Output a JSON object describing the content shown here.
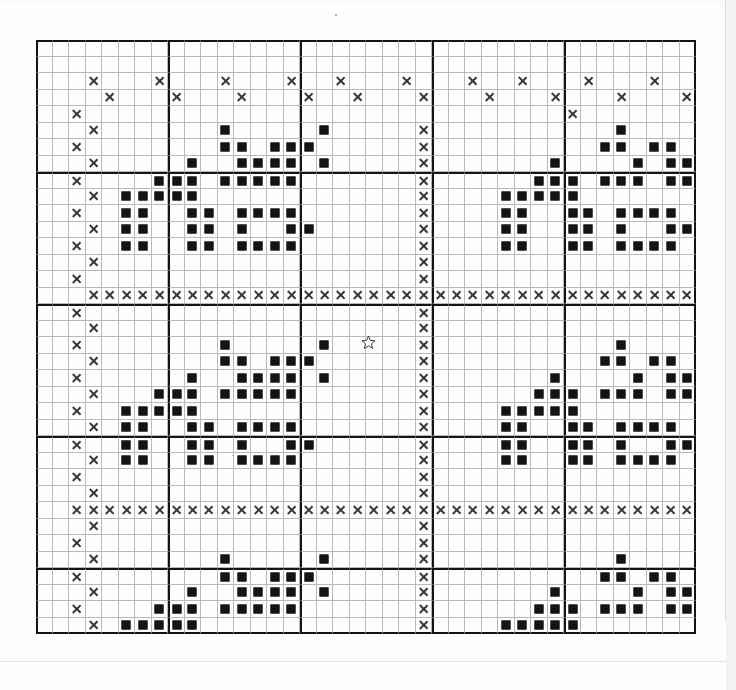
{
  "document": {
    "type": "cross-stitch-pattern-chart",
    "title": "Cross Stitch Pattern Chart",
    "background_color": "#ffffff",
    "grid_line_color": "#b9b9b9",
    "bold_line_color": "#141414",
    "symbol_x_color": "#3a3a3a",
    "symbol_square_color": "#141414"
  },
  "grid": {
    "columns": 40,
    "rows": 36,
    "cell_size_px": 16.5,
    "bold_block_size": 8,
    "origin_x_px": 36,
    "origin_y_px": 40,
    "width_px": 660,
    "height_px": 594
  },
  "legend": {
    "symbols": [
      {
        "key": "x",
        "name": "cross-symbol",
        "glyph": "X",
        "meaning": "backstitch-lattice-thread"
      },
      {
        "key": "s",
        "name": "filled-square-symbol",
        "glyph": "■",
        "meaning": "full-cross-stitch"
      }
    ]
  },
  "cursor": {
    "name": "star-cursor",
    "visible": true,
    "x_px": 361,
    "y_px": 335
  },
  "chart_data": {
    "type": "heatmap",
    "xlabel": "",
    "ylabel": "",
    "legend_position": "none",
    "grid": true,
    "columns": 40,
    "rows": 36,
    "symbol_codes": {
      "blank": ".",
      "cross": "x",
      "square": "s"
    },
    "cells": [
      "........................................",
      "........................................",
      "...x...x...x...x..x...x...x..x...x...x..",
      "....x...x...x...x..x...x...x...x...x...x",
      "..x.............................x.......",
      "...x.......s.....s.....x...........s....",
      "..x........ss.sss......x..........ss.ss.",
      "...x.....s..ssss.s.....x.......s....s.ss",
      "..x....sss.sssss.......x......sss.sss.ss",
      "...x.sssss.............x....sssss.......",
      "..x..ss..ss.ssss.......x....ss..ss.ssss.",
      "...x.ss..ss.s..ss......x....ss..ss.s..ss",
      "..x..ss..ss.ssss.......x....ss..ss.ssss.",
      "...x...................x................",
      "..x....................x................",
      "...xxxxxxxxxxxxxxxxxxxxxxxxxxxxxxxxxxxxx",
      "..x....................x................",
      "...x...................x................",
      "..x........s.....s.....x...........s....",
      "...x.......ss.sss......x..........ss.ss.",
      "..x......s..ssss.s.....x.......s....s.ss",
      "...x...sss.sssss.......x......sss.sss.ss",
      "..x..sssss.............x....sssss.......",
      "...x.ss..ss.ssss.......x....ss..ss.ssss.",
      "..x..ss..ss.s..ss......x....ss..ss.s..ss",
      "...x.ss..ss.ssss.......x....ss..ss.ssss.",
      "..x....................x................",
      "...x...................x................",
      "..xxxxxxxxxxxxxxxxxxxxxxxxxxxxxxxxxxxxxx",
      "...x...................x................",
      "..x....................x................",
      "...x.......s.....s.....x...........s....",
      "..x........ss.sss......x..........ss.ss.",
      "...x.....s..ssss.s.....x.......s....s.ss",
      "..x....sss.sssss.......x......sss.sss.ss",
      "...x.sssss.............x....sssss......."
    ]
  }
}
